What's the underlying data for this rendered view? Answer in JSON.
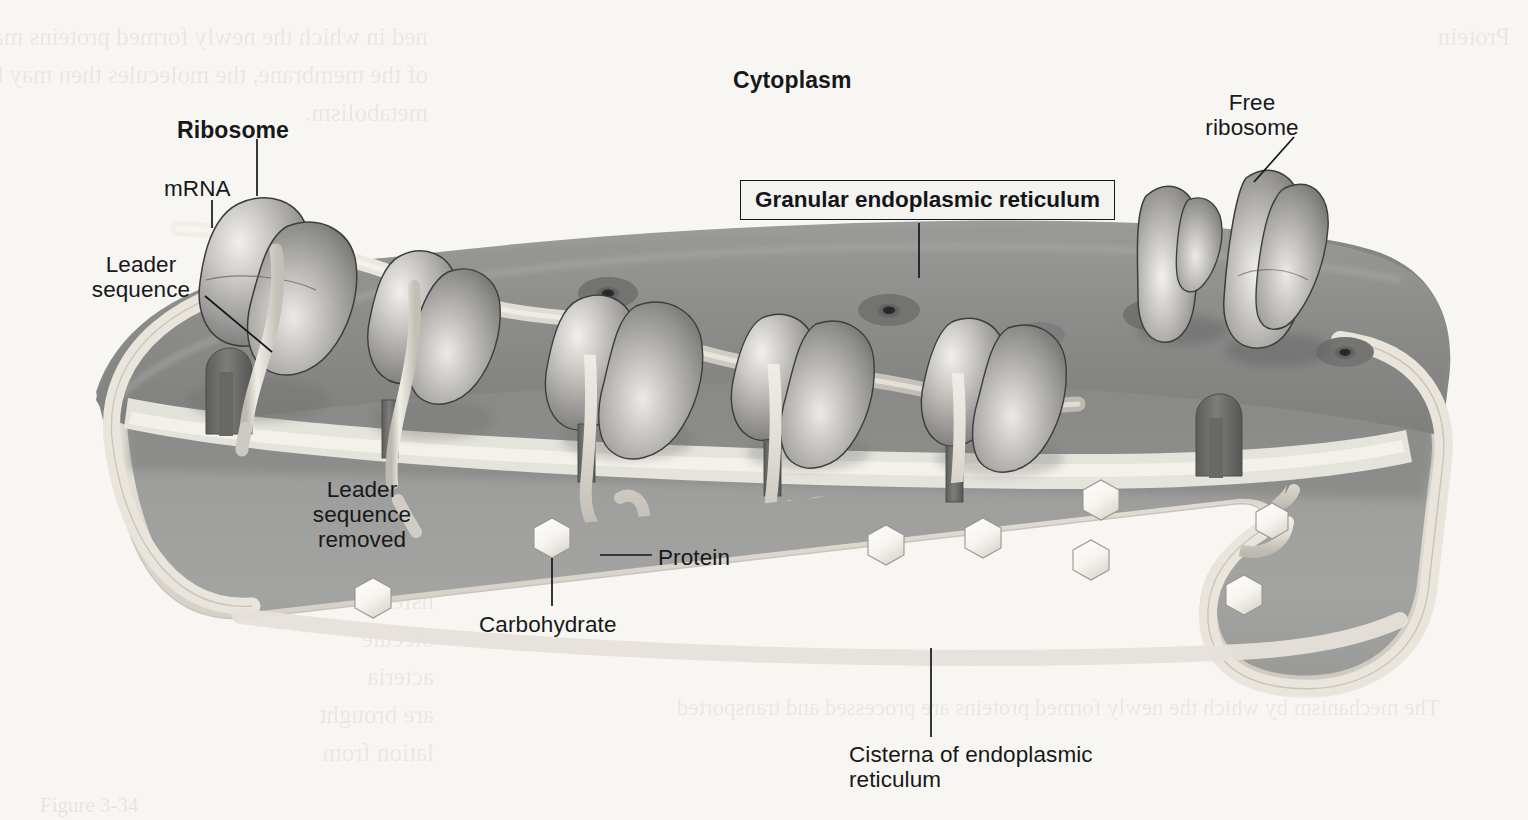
{
  "figure": {
    "domain": "biology-cell-diagram",
    "width": 1528,
    "height": 820
  },
  "labels": {
    "cytoplasm": "Cytoplasm",
    "ribosome": "Ribosome",
    "granular_er": "Granular endoplasmic reticulum",
    "free_ribosome": "Free\nribosome",
    "mrna": "mRNA",
    "leader_sequence": "Leader\nsequence",
    "leader_sequence_removed": "Leader\nsequence\nremoved",
    "protein": "Protein",
    "carbohydrate": "Carbohydrate",
    "cisterna": "Cisterna of endoplasmic\nreticulum"
  },
  "label_styles": {
    "bold_labels": [
      "Cytoplasm",
      "Ribosome",
      "Granular endoplasmic reticulum"
    ],
    "boxed_labels": [
      "Granular endoplasmic reticulum"
    ]
  },
  "colors": {
    "page_background": "#f7f6f3",
    "er_top_surface": "#8d8d8d",
    "er_membrane_band": "#dedad2",
    "er_lumen": "#9a9a99",
    "er_lumen_shadow": "#878786",
    "ribosome_mid": "#9c9c9c",
    "ribosome_highlight": "#eceae6",
    "ribosome_outline": "#3c3c3c",
    "mrna_strand": "#ded9d1",
    "protein_chain": "#e4e0d8",
    "carbohydrate_fill": "#fbfaf7",
    "pore_fill": "#6e6e6e",
    "pore_center": "#2b2b2b",
    "text": "#17181a",
    "leader_line": "#15161a"
  },
  "structures": {
    "ribosome_pairs_on_er": 5,
    "free_ribosomes": 2,
    "membrane_pores_visible": 5,
    "translocon_channels": 5,
    "carbohydrate_hexagons": 8,
    "description": "A single large cisterna of granular (rough) endoplasmic reticulum seen in three-quarter view. Ribosome pairs sit on the cytoplasmic face threaded by a single mRNA strand; nascent polypeptides pass through translocon channels into the lumen where they fold and acquire carbohydrate groups."
  },
  "showthrough_text": {
    "left_top": "ned in which the newly formed proteins may exist. Once\nof the membrane, the molecules then may be transported in\nmetabolism.",
    "left_mid": "ough\nesult of\nonsider a\nhe linked\nnsfer so\nolecule\nacteria\nare brought\nlation from",
    "right_top": "Protein",
    "bottom": "The mechanism by which the newly formed proteins are processed and transported",
    "caption": "Figure 3-34"
  }
}
